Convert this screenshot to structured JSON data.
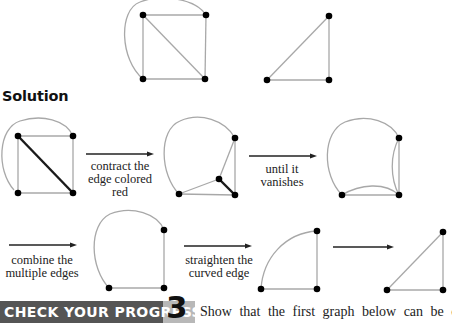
{
  "heading": "Solution",
  "colors": {
    "edge": "#a8a8a8",
    "highlight_edge": "#1a1a1a",
    "node": "#000000",
    "banner_bg": "#555555",
    "banner_num_bg": "#b8b8b8",
    "banner_text": "#ffffff"
  },
  "steps": [
    {
      "label_lines": [
        "contract the",
        "edge colored",
        "red"
      ]
    },
    {
      "label_lines": [
        "until it",
        "vanishes"
      ]
    },
    {
      "label_lines": [
        "combine the",
        "multiple edges"
      ]
    },
    {
      "label_lines": [
        "straighten the",
        "curved edge"
      ]
    },
    {
      "label_lines": []
    }
  ],
  "check_your_progress": {
    "label": "CHECK YOUR PROGRESS",
    "number": "3",
    "text": "Show that the first graph below can be con-"
  }
}
